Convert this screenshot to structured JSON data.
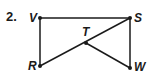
{
  "problem": {
    "number": "2."
  },
  "diagram": {
    "points": [
      {
        "label": "V",
        "x": 40,
        "y": 18
      },
      {
        "label": "S",
        "x": 130,
        "y": 18
      },
      {
        "label": "T",
        "x": 86,
        "y": 43
      },
      {
        "label": "R",
        "x": 40,
        "y": 66
      },
      {
        "label": "W",
        "x": 130,
        "y": 68
      }
    ],
    "segments": [
      [
        "V",
        "S"
      ],
      [
        "V",
        "R"
      ],
      [
        "S",
        "W"
      ],
      [
        "R",
        "S"
      ],
      [
        "T",
        "W"
      ]
    ],
    "line_color": "#1a1a1a"
  }
}
